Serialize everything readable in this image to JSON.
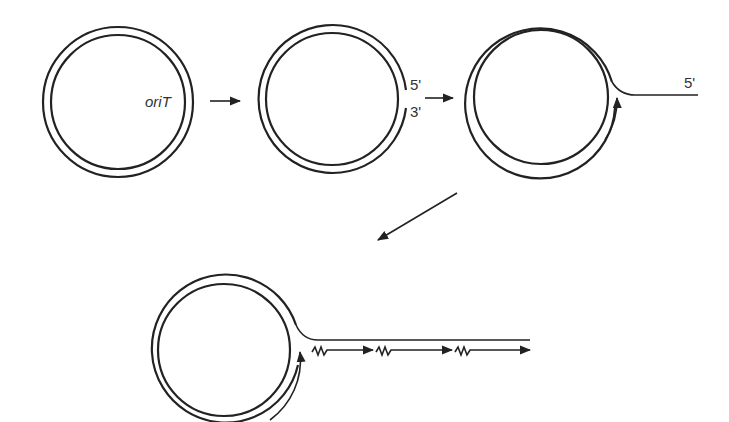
{
  "diagram": {
    "title": "",
    "stages": [
      {
        "id": "plasmid",
        "labels": {
          "origin": "oriT"
        }
      },
      {
        "id": "nicked",
        "labels": {
          "five_prime": "5'",
          "three_prime": "3'"
        }
      },
      {
        "id": "displacement",
        "labels": {
          "five_prime": "5'"
        }
      },
      {
        "id": "transfer-replication",
        "labels": {}
      }
    ],
    "flow": [
      "plasmid",
      "nicked",
      "displacement",
      "transfer-replication"
    ],
    "colors": {
      "ink": "#222222",
      "background": "#ffffff"
    }
  }
}
